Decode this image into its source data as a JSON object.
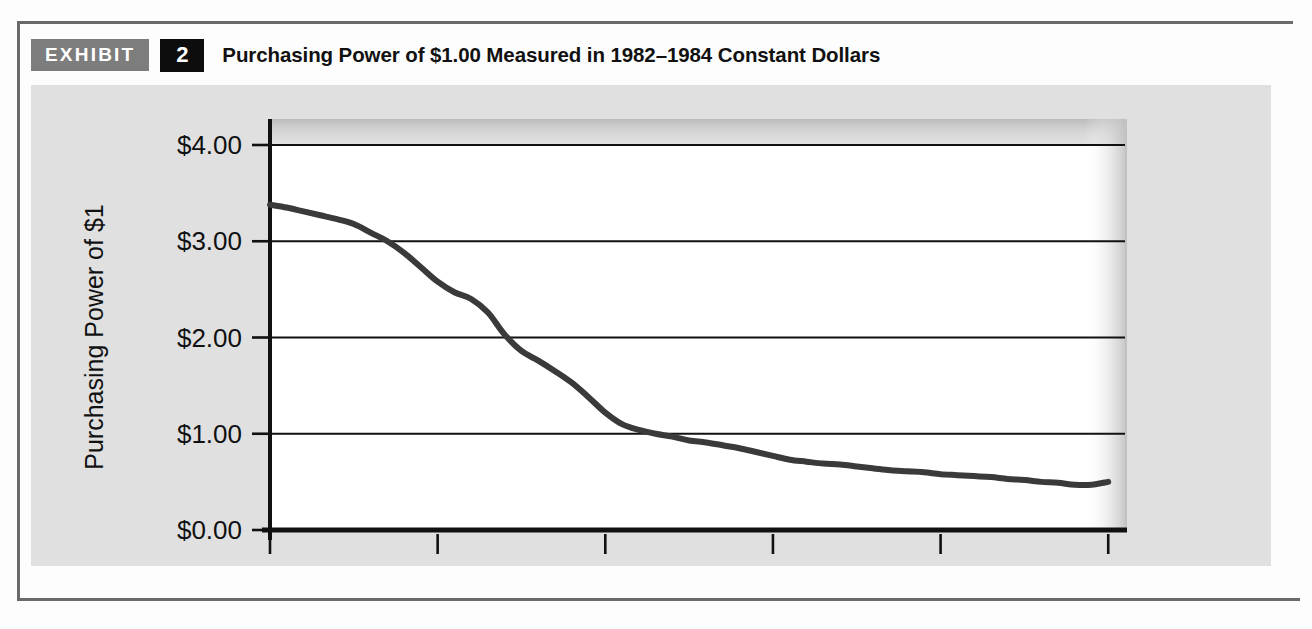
{
  "exhibit": {
    "badge_label": "EXHIBIT",
    "number": "2",
    "title": "Purchasing Power of $1.00 Measured in 1982–1984 Constant Dollars"
  },
  "colors": {
    "badge_gray": "#7d7d7d",
    "number_black": "#0d0d0d",
    "panel_gray": "#e0e0e0",
    "plot_white": "#ffffff",
    "line_color": "#3a3a3a",
    "axis_color": "#111111",
    "grid_color": "#111111",
    "frame_gray": "#6a6a6a"
  },
  "chart_data": {
    "type": "line",
    "title": "Purchasing Power of $1.00 Measured in 1982–1984 Constant Dollars",
    "xlabel": "",
    "ylabel": "Purchasing Power of $1",
    "xlim": [
      1960,
      2011
    ],
    "ylim": [
      0,
      4
    ],
    "grid": true,
    "legend": null,
    "y_ticks": [
      0,
      1,
      2,
      3,
      4
    ],
    "y_tick_labels": [
      "$0.00",
      "$1.00",
      "$2.00",
      "$3.00",
      "$4.00"
    ],
    "x_ticks": [
      1960,
      1970,
      1980,
      1990,
      2000,
      2010
    ],
    "x_tick_labels": [
      "1960",
      "1970",
      "1980",
      "1990",
      "2000",
      "2010"
    ],
    "series": [
      {
        "name": "Purchasing Power of $1",
        "x": [
          1960,
          1961,
          1962,
          1963,
          1964,
          1965,
          1966,
          1967,
          1968,
          1969,
          1970,
          1971,
          1972,
          1973,
          1974,
          1975,
          1976,
          1977,
          1978,
          1979,
          1980,
          1981,
          1982,
          1983,
          1984,
          1985,
          1986,
          1987,
          1988,
          1989,
          1990,
          1991,
          1992,
          1993,
          1994,
          1995,
          1996,
          1997,
          1998,
          1999,
          2000,
          2001,
          2002,
          2003,
          2004,
          2005,
          2006,
          2007,
          2008,
          2009,
          2010
        ],
        "y": [
          3.38,
          3.35,
          3.31,
          3.27,
          3.23,
          3.18,
          3.09,
          3.0,
          2.88,
          2.73,
          2.58,
          2.47,
          2.4,
          2.26,
          2.03,
          1.86,
          1.76,
          1.65,
          1.53,
          1.38,
          1.22,
          1.1,
          1.04,
          1.0,
          0.97,
          0.93,
          0.91,
          0.88,
          0.85,
          0.81,
          0.77,
          0.73,
          0.71,
          0.69,
          0.68,
          0.66,
          0.64,
          0.62,
          0.61,
          0.6,
          0.58,
          0.57,
          0.56,
          0.55,
          0.53,
          0.52,
          0.5,
          0.49,
          0.47,
          0.47,
          0.5
        ]
      }
    ]
  },
  "axis": {
    "y_label_text": "Purchasing Power of $1"
  }
}
